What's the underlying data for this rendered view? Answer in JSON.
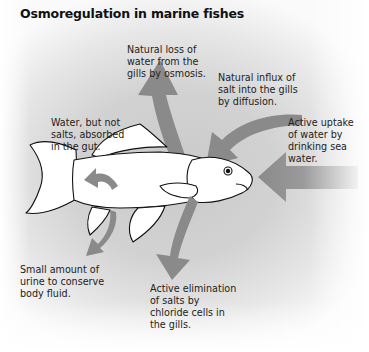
{
  "title": "Osmoregulation in marine fishes",
  "labels": {
    "water_loss": "Natural loss of\nwater from the\ngills by osmosis.",
    "salt_influx": "Natural influx of\nsalt into the gills\nby diffusion.",
    "drinking": "Active uptake\nof water by\ndrinking sea\nwater.",
    "gut_absorption": "Water, but not\nsalts, absorbed\nin the gut.",
    "urine": "Small amount of\nurine to conserve\nbody fluid.",
    "salt_elimination": "Active elimination\nof salts by\nchloride cells in\nthe gills."
  },
  "colors": {
    "arrow": "#8a8a8a",
    "fish_fill": "#ffffff",
    "fish_outline": "#111111"
  }
}
